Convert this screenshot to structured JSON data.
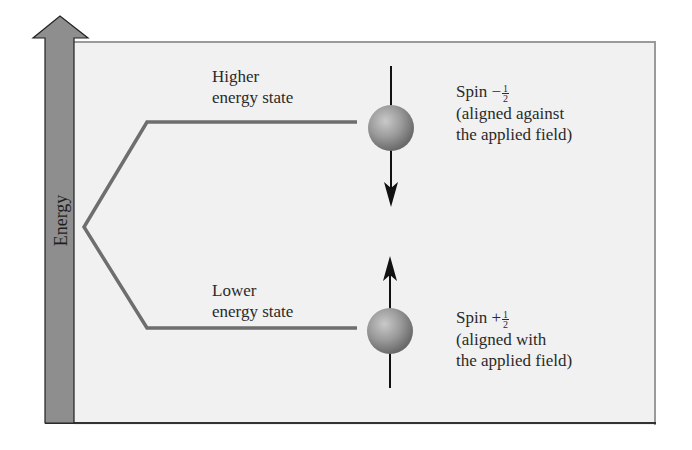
{
  "diagram": {
    "axis": {
      "label": "Energy",
      "bar_color": "#8e8e8e",
      "arrow_direction": "up"
    },
    "panel_background": "#f1f1f1",
    "levels": [
      {
        "id": "higher",
        "title_line1": "Higher",
        "title_line2": "energy state",
        "spin_prefix": "Spin −",
        "spin_num": "1",
        "spin_den": "2",
        "desc_line1": "(aligned against",
        "desc_line2": "the applied field)",
        "arrow_direction": "down"
      },
      {
        "id": "lower",
        "title_line1": "Lower",
        "title_line2": "energy state",
        "spin_prefix": "Spin +",
        "spin_num": "1",
        "spin_den": "2",
        "desc_line1": "(aligned with",
        "desc_line2": "the applied field)",
        "arrow_direction": "up"
      }
    ],
    "colors": {
      "level_line": "#6e6e6e",
      "sphere": "#9a9a9a",
      "arrow": "#111111"
    }
  }
}
